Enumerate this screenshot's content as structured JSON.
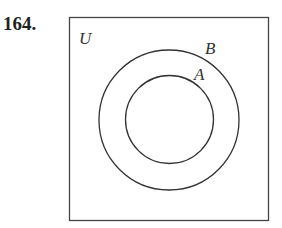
{
  "problem_number": "164.",
  "diagram": {
    "type": "venn",
    "universe_label": "U",
    "sets": [
      {
        "label": "B",
        "role": "outer circle"
      },
      {
        "label": "A",
        "role": "inner circle, subset of B"
      }
    ]
  }
}
